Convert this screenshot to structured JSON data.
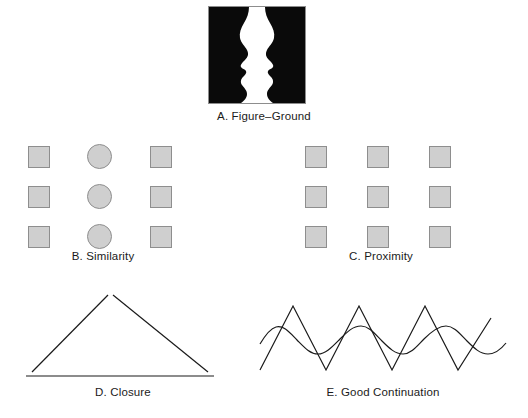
{
  "figure": {
    "background_color": "#ffffff",
    "width": 528,
    "height": 418
  },
  "style": {
    "shape_fill": "#cfcfcf",
    "shape_stroke": "#8e8e8e",
    "line_color": "#1a1a1a",
    "caption_color": "#1b1b1b",
    "frame_color": "#8d8d8d"
  },
  "panels": [
    {
      "id": "a",
      "letter": "A.",
      "name": "Figure–Ground",
      "caption": "A.  Figure–Ground",
      "type": "rubin-faces-vase",
      "description": "Black silhouettes of two facing profiles forming a white vase shape between them",
      "frame": {
        "width": 96,
        "height": 96,
        "border": 1
      },
      "colors": {
        "figure": "#0a0a0a",
        "ground": "#ffffff"
      }
    },
    {
      "id": "b",
      "letter": "B.",
      "name": "Similarity",
      "caption": "B.  Similarity",
      "type": "shape-grid",
      "rows": 3,
      "columns": 3,
      "column_shapes": [
        "square",
        "circle",
        "square"
      ],
      "column_x": [
        0,
        60,
        122
      ],
      "row_y": [
        0,
        40,
        80
      ],
      "square_size": 22,
      "circle_size": 25
    },
    {
      "id": "c",
      "letter": "C.",
      "name": "Proximity",
      "caption": "C.  Proximity",
      "type": "shape-grid",
      "rows": 3,
      "columns": 3,
      "column_shapes": [
        "square",
        "square",
        "square"
      ],
      "column_x": [
        0,
        62,
        124
      ],
      "row_y": [
        0,
        40,
        80
      ],
      "square_size": 22
    },
    {
      "id": "d",
      "letter": "D.",
      "name": "Closure",
      "caption": "D.  Closure",
      "type": "open-triangle",
      "description": "Triangle outline with small gaps at each vertex",
      "vertices": [
        [
          92,
          4
        ],
        [
          10,
          86
        ],
        [
          196,
          86
        ]
      ],
      "gap": 5,
      "stroke_width": 1.2
    },
    {
      "id": "e",
      "letter": "E.",
      "name": "Good Continuation",
      "caption": "E.  Good Continuation",
      "type": "zigzag-over-wave",
      "description": "A sharp zigzag line crossing a smooth sine wave",
      "zigzag": {
        "points": [
          [
            2,
            82
          ],
          [
            35,
            18
          ],
          [
            68,
            82
          ],
          [
            101,
            18
          ],
          [
            134,
            82
          ],
          [
            167,
            18
          ],
          [
            200,
            82
          ],
          [
            233,
            30
          ]
        ],
        "peak_y": 18,
        "trough_y": 82,
        "stroke_width": 1.2
      },
      "wave": {
        "baseline_y": 52,
        "amplitude": 14,
        "wavelength": 66,
        "x_start": 2,
        "x_end": 240,
        "stroke_width": 1.2
      }
    }
  ]
}
